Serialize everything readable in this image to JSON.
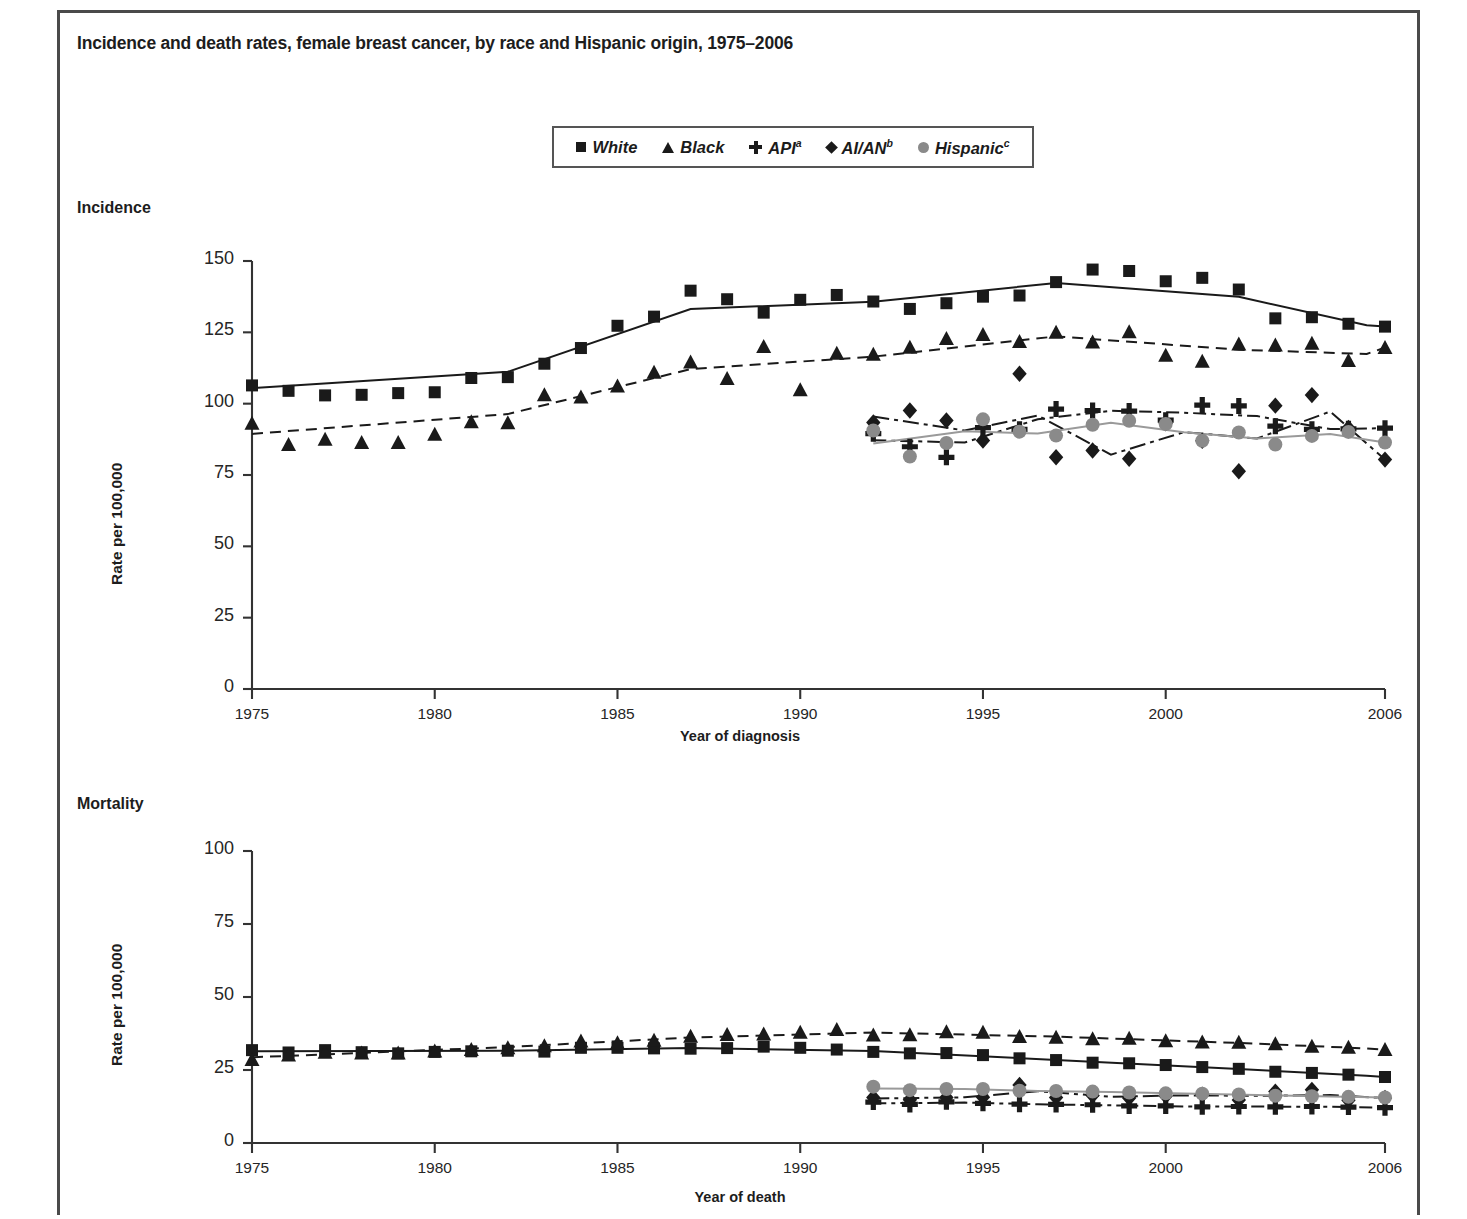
{
  "title": "Incidence and death rates, female breast cancer, by race and Hispanic origin, 1975–2006",
  "legend": {
    "items": [
      {
        "label": "White",
        "sup": "",
        "marker": "square",
        "color": "#1a1a1a",
        "icon": "square-marker-icon"
      },
      {
        "label": "Black",
        "sup": "",
        "marker": "triangle",
        "color": "#1a1a1a",
        "icon": "triangle-marker-icon"
      },
      {
        "label": "API",
        "sup": "a",
        "marker": "plus",
        "color": "#1a1a1a",
        "icon": "plus-marker-icon"
      },
      {
        "label": "AI/AN",
        "sup": "b",
        "marker": "diamond",
        "color": "#1a1a1a",
        "icon": "diamond-marker-icon"
      },
      {
        "label": "Hispanic",
        "sup": "c",
        "marker": "circle",
        "color": "#8a8a8a",
        "icon": "circle-marker-icon"
      }
    ]
  },
  "panels": {
    "incidence": {
      "label": "Incidence"
    },
    "mortality": {
      "label": "Mortality"
    }
  },
  "chart_data": [
    {
      "type": "line",
      "title": "Incidence",
      "xlabel": "Year of diagnosis",
      "ylabel": "Rate per 100,000",
      "xlim": [
        1975,
        2006
      ],
      "ylim": [
        0,
        150
      ],
      "yticks": [
        0,
        25,
        50,
        75,
        100,
        125,
        150
      ],
      "xticks": [
        1975,
        1980,
        1985,
        1990,
        1995,
        2000,
        2006
      ],
      "grid": false,
      "legend_position": "top-center",
      "x": [
        1975,
        1976,
        1977,
        1978,
        1979,
        1980,
        1981,
        1982,
        1983,
        1984,
        1985,
        1986,
        1987,
        1988,
        1989,
        1990,
        1991,
        1992,
        1993,
        1994,
        1995,
        1996,
        1997,
        1998,
        1999,
        2000,
        2001,
        2002,
        2003,
        2004,
        2005,
        2006
      ],
      "series": [
        {
          "name": "White",
          "marker": "square",
          "linestyle": "solid",
          "color": "#1a1a1a",
          "values": [
            106.4,
            104.5,
            102.9,
            103.1,
            103.7,
            104.0,
            109.0,
            109.3,
            114.0,
            119.5,
            127.3,
            130.5,
            139.6,
            136.6,
            131.9,
            136.4,
            138.1,
            135.8,
            133.2,
            135.2,
            137.5,
            137.9,
            142.6,
            147.0,
            146.5,
            142.9,
            144.1,
            140.0,
            129.9,
            130.3,
            128.0,
            127.0
          ]
        },
        {
          "name": "Black",
          "marker": "triangle",
          "linestyle": "dashed",
          "color": "#1a1a1a",
          "values": [
            93.1,
            85.7,
            87.5,
            86.4,
            86.4,
            89.3,
            93.7,
            93.3,
            103.1,
            102.3,
            106.2,
            111.0,
            114.6,
            108.8,
            120.0,
            104.9,
            117.7,
            117.3,
            119.8,
            122.8,
            124.2,
            121.8,
            125.0,
            121.6,
            125.2,
            117.0,
            114.9,
            120.9,
            120.6,
            121.2,
            115.1,
            119.7
          ]
        },
        {
          "name": "API",
          "marker": "plus",
          "linestyle": "dashdot",
          "color": "#1a1a1a",
          "values": [
            null,
            null,
            null,
            null,
            null,
            null,
            null,
            null,
            null,
            null,
            null,
            null,
            null,
            null,
            null,
            null,
            null,
            89.5,
            84.9,
            81.2,
            91.6,
            91.0,
            98.1,
            97.6,
            97.4,
            94.2,
            99.5,
            99.2,
            92.1,
            91.0,
            91.2,
            91.4
          ]
        },
        {
          "name": "AI/AN",
          "marker": "diamond",
          "linestyle": "dashdot-long",
          "color": "#1a1a1a",
          "values": [
            null,
            null,
            null,
            null,
            null,
            null,
            null,
            null,
            null,
            null,
            null,
            null,
            null,
            null,
            null,
            null,
            null,
            93.4,
            97.6,
            94.1,
            87.1,
            110.5,
            81.2,
            83.6,
            80.7,
            93.1,
            87.0,
            76.3,
            99.3,
            103.0,
            91.5,
            80.4
          ]
        },
        {
          "name": "Hispanic",
          "marker": "circle",
          "linestyle": "solid-gray",
          "color": "#8a8a8a",
          "values": [
            null,
            null,
            null,
            null,
            null,
            null,
            null,
            null,
            null,
            null,
            null,
            null,
            null,
            null,
            null,
            null,
            null,
            90.6,
            81.5,
            86.2,
            94.5,
            90.2,
            88.8,
            92.6,
            94.0,
            92.9,
            87.0,
            89.9,
            85.7,
            88.7,
            90.1,
            86.4
          ]
        }
      ]
    },
    {
      "type": "line",
      "title": "Mortality",
      "xlabel": "Year of death",
      "ylabel": "Rate per 100,000",
      "xlim": [
        1975,
        2006
      ],
      "ylim": [
        0,
        100
      ],
      "yticks": [
        0,
        25,
        50,
        75,
        100
      ],
      "xticks": [
        1975,
        1980,
        1985,
        1990,
        1995,
        2000,
        2006
      ],
      "grid": false,
      "legend_position": "top-center",
      "x": [
        1975,
        1976,
        1977,
        1978,
        1979,
        1980,
        1981,
        1982,
        1983,
        1984,
        1985,
        1986,
        1987,
        1988,
        1989,
        1990,
        1991,
        1992,
        1993,
        1994,
        1995,
        1996,
        1997,
        1998,
        1999,
        2000,
        2001,
        2002,
        2003,
        2004,
        2005,
        2006
      ],
      "series": [
        {
          "name": "White",
          "marker": "square",
          "linestyle": "solid",
          "color": "#1a1a1a",
          "values": [
            31.8,
            31.0,
            31.8,
            31.1,
            30.7,
            31.2,
            31.4,
            31.6,
            31.3,
            32.6,
            32.6,
            32.4,
            32.3,
            32.5,
            33.0,
            32.6,
            32.0,
            31.2,
            30.7,
            30.8,
            30.1,
            29.0,
            28.4,
            27.5,
            27.3,
            26.7,
            26.0,
            25.4,
            24.4,
            24.0,
            23.4,
            22.6
          ]
        },
        {
          "name": "Black",
          "marker": "triangle",
          "linestyle": "dashed",
          "color": "#1a1a1a",
          "values": [
            28.6,
            30.1,
            31.1,
            30.8,
            30.8,
            31.5,
            32.0,
            32.6,
            33.3,
            34.9,
            34.3,
            35.2,
            36.6,
            37.2,
            37.3,
            37.9,
            38.9,
            37.0,
            37.1,
            38.1,
            37.9,
            36.5,
            36.2,
            35.7,
            35.9,
            35.0,
            34.6,
            34.5,
            34.0,
            33.1,
            32.8,
            32.0
          ]
        },
        {
          "name": "API",
          "marker": "plus",
          "linestyle": "dashdot",
          "color": "#1a1a1a",
          "values": [
            null,
            null,
            null,
            null,
            null,
            null,
            null,
            null,
            null,
            null,
            null,
            null,
            null,
            null,
            null,
            null,
            null,
            14.0,
            13.2,
            14.1,
            13.6,
            13.3,
            13.2,
            13.1,
            12.7,
            12.7,
            12.4,
            12.5,
            12.4,
            12.5,
            12.3,
            12.1
          ]
        },
        {
          "name": "AI/AN",
          "marker": "diamond",
          "linestyle": "dashdot-long",
          "color": "#1a1a1a",
          "values": [
            null,
            null,
            null,
            null,
            null,
            null,
            null,
            null,
            null,
            null,
            null,
            null,
            null,
            null,
            null,
            null,
            null,
            15.6,
            14.8,
            15.6,
            15.7,
            19.9,
            15.6,
            16.3,
            15.4,
            16.1,
            16.5,
            14.7,
            17.6,
            18.2,
            14.6,
            15.4
          ]
        },
        {
          "name": "Hispanic",
          "marker": "circle",
          "linestyle": "solid-gray",
          "color": "#8a8a8a",
          "values": [
            null,
            null,
            null,
            null,
            null,
            null,
            null,
            null,
            null,
            null,
            null,
            null,
            null,
            null,
            null,
            null,
            null,
            19.3,
            18.1,
            18.5,
            18.5,
            17.9,
            17.8,
            17.6,
            17.3,
            17.0,
            16.9,
            16.6,
            16.2,
            16.0,
            15.8,
            15.6
          ]
        }
      ]
    }
  ]
}
